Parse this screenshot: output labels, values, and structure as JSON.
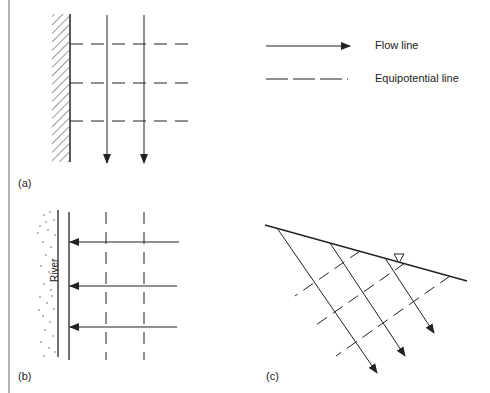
{
  "legend": {
    "flow_line": "Flow line",
    "equipotential_line": "Equipotential line"
  },
  "panels": {
    "a": {
      "label": "(a)"
    },
    "b": {
      "label": "(b)",
      "river_label": "River"
    },
    "c": {
      "label": "(c)"
    }
  },
  "icons": {
    "water_table": "inverted-triangle"
  },
  "colors": {
    "line": "#222222",
    "background": "#ffffff"
  }
}
